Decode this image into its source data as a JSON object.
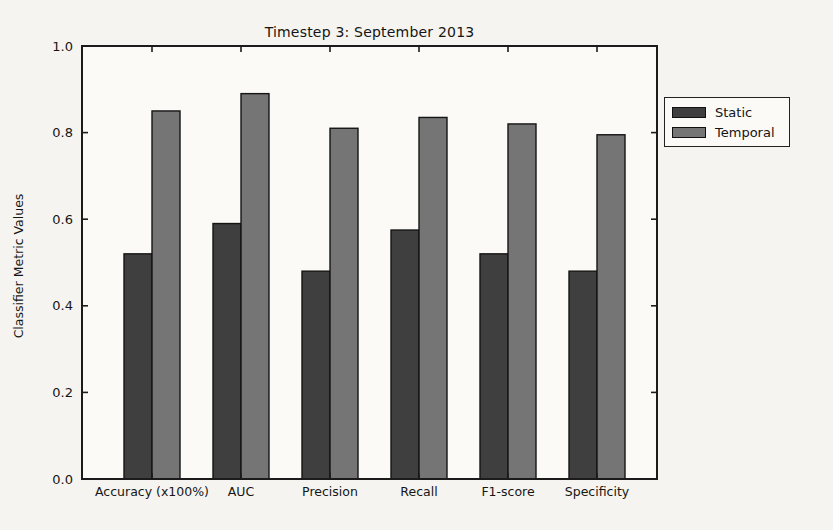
{
  "page": {
    "background": "#f5f4f0"
  },
  "colors": {
    "plot_background": "#fbfaf7",
    "spine": "#1b1b1b",
    "text": "#161616",
    "static_fill": "#3f3f3f",
    "temporal_fill": "#757575",
    "bar_edge": "#151515"
  },
  "chart_data": {
    "type": "bar",
    "title": "Timestep 3: September 2013",
    "xlabel": "",
    "ylabel": "Classifier Metric Values",
    "categories": [
      "Accuracy (x100%)",
      "AUC",
      "Precision",
      "Recall",
      "F1-score",
      "Specificity"
    ],
    "series": [
      {
        "name": "Static",
        "color": "#3f3f3f",
        "values": [
          0.52,
          0.59,
          0.48,
          0.575,
          0.52,
          0.48
        ]
      },
      {
        "name": "Temporal",
        "color": "#757575",
        "values": [
          0.85,
          0.89,
          0.81,
          0.835,
          0.82,
          0.795
        ]
      }
    ],
    "ylim": [
      0.0,
      1.0
    ],
    "yticks": [
      0.0,
      0.2,
      0.4,
      0.6,
      0.8,
      1.0
    ],
    "grid": false,
    "legend_position": "outside-right"
  }
}
